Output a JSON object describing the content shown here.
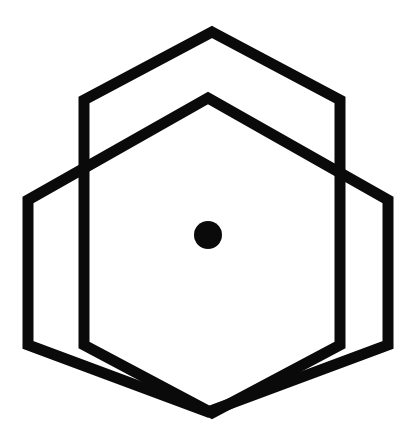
{
  "artwork": {
    "title": "Interlocking Hexagons Mark",
    "kind": "logo",
    "background_color": "#ffffff",
    "stroke_color": "#0a0a0a",
    "fill_color": "#0a0a0a",
    "stroke_width": 11,
    "canvas": {
      "width": 416,
      "height": 448
    }
  },
  "chart_data": {
    "type": "diagram",
    "xlabel": "",
    "ylabel": "",
    "grid": false,
    "legend": "none",
    "xlim": [
      0,
      416
    ],
    "ylim": [
      0,
      448
    ],
    "shapes": [
      {
        "name": "hexagon-upper-left",
        "type": "polygon",
        "closed": true,
        "stroke": "#0a0a0a",
        "fill": "none",
        "stroke_width": 11,
        "points": "212,32 340,100 340,345 212,413 84,345 84,100"
      },
      {
        "name": "hexagon-lower-right",
        "type": "polygon",
        "closed": true,
        "stroke": "#0a0a0a",
        "fill": "none",
        "stroke_width": 11,
        "points": "208,98 388,200 388,345 208,412 28,345 28,200"
      },
      {
        "name": "center-dot",
        "type": "circle",
        "fill": "#0a0a0a",
        "stroke": "none",
        "cx": 208,
        "cy": 235,
        "r": 14
      }
    ]
  },
  "elements": {
    "hex_back_label": "Outer hexagon outline",
    "hex_front_label": "Inner hexagon outline",
    "dot_label": "Center dot"
  }
}
